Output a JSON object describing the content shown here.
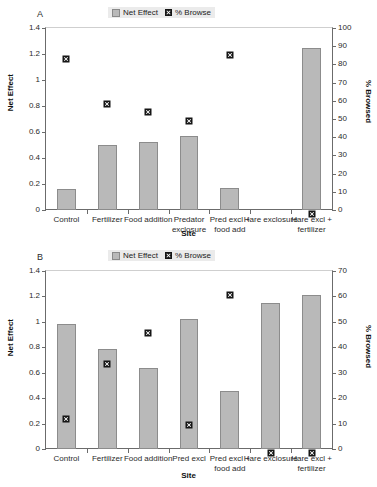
{
  "figure": {
    "legend": {
      "bar_label": "Net Effect",
      "marker_label": "% Browse"
    },
    "colors": {
      "bar_fill": "#b9b9b9",
      "bar_stroke": "#8c8c8c",
      "marker": "#151515",
      "axis": "#6b6b6b",
      "legend_bg": "#ebebeb"
    }
  },
  "chart_data": [
    {
      "type": "bar",
      "panel": "A",
      "title": "",
      "xlabel": "Site",
      "ylabel": "Net Effect",
      "y2label": "% Browsed",
      "ylim": [
        0,
        1.4
      ],
      "y2lim": [
        0,
        100
      ],
      "yticks": [
        "0",
        "0.2",
        "0.4",
        "0.6",
        "0.8",
        "1",
        "1.2",
        "1.4"
      ],
      "y2ticks": [
        "0",
        "10",
        "20",
        "30",
        "40",
        "50",
        "60",
        "70",
        "80",
        "90",
        "100"
      ],
      "grid": false,
      "legend_position": "top-center",
      "categories": [
        "Control",
        "Fertilizer",
        "Food addition",
        "Predator exclosure",
        "Pred excl + food add",
        "Hare exclosure",
        "Hare excl + fertilizer"
      ],
      "series": [
        {
          "name": "Net Effect",
          "axis": "left",
          "render": "bar",
          "values": [
            0.16,
            0.5,
            0.52,
            0.57,
            0.17,
            0,
            1.25
          ]
        },
        {
          "name": "% Browse",
          "axis": "right",
          "render": "marker",
          "values": [
            85,
            60,
            56,
            51,
            87,
            null,
            0
          ]
        }
      ]
    },
    {
      "type": "bar",
      "panel": "B",
      "title": "",
      "xlabel": "Site",
      "ylabel": "Net Effect",
      "y2label": "% Browsed",
      "ylim": [
        0,
        1.4
      ],
      "y2lim": [
        0,
        70
      ],
      "yticks": [
        "0",
        "0.2",
        "0.4",
        "0.6",
        "0.8",
        "1",
        "1.2",
        "1.4"
      ],
      "y2ticks": [
        "0",
        "10",
        "20",
        "30",
        "40",
        "50",
        "60",
        "70"
      ],
      "grid": false,
      "legend_position": "top-center",
      "categories": [
        "Control",
        "Fertilizer",
        "Food addition",
        "Pred excl",
        "Pred excl + food add",
        "Hare exclosure",
        "Hare excl + fertilizer"
      ],
      "series": [
        {
          "name": "Net Effect",
          "axis": "left",
          "render": "bar",
          "values": [
            0.98,
            0.79,
            0.64,
            1.02,
            0.455,
            1.15,
            1.21
          ]
        },
        {
          "name": "% Browse",
          "axis": "right",
          "render": "marker",
          "values": [
            13,
            35,
            47,
            11,
            62,
            0,
            0
          ]
        }
      ]
    }
  ]
}
